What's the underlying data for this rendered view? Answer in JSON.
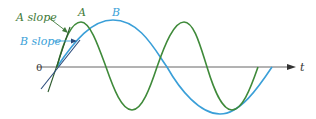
{
  "labels": {
    "a_curve": "A",
    "b_curve": "B",
    "a_slope": "A slope",
    "b_slope": "B slope",
    "origin": "0",
    "t_axis": "t"
  },
  "colors": {
    "a": "#3f8a3a",
    "b": "#3a9fd8",
    "axis": "#555555",
    "a_text": "#3f7a3a",
    "b_text": "#3a9fd8",
    "tangent": "#2a4a7a"
  }
}
